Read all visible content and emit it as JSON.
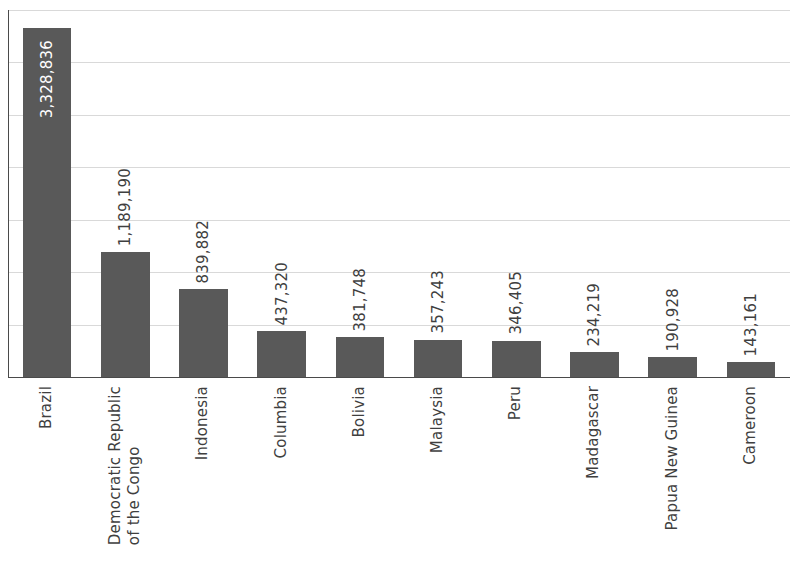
{
  "chart_data": {
    "type": "bar",
    "title": "",
    "subtitle": "",
    "xlabel": "",
    "ylabel": "",
    "categories": [
      "Brazil",
      "Democratic Republic of the Congo",
      "Indonesia",
      "Columbia",
      "Bolivia",
      "Malaysia",
      "Peru",
      "Madagascar",
      "Papua New Guinea",
      "Cameroon"
    ],
    "category_lines": [
      [
        "Brazil"
      ],
      [
        "Democratic Republic",
        "of the Congo"
      ],
      [
        "Indonesia"
      ],
      [
        "Columbia"
      ],
      [
        "Bolivia"
      ],
      [
        "Malaysia"
      ],
      [
        "Peru"
      ],
      [
        "Madagascar"
      ],
      [
        "Papua New Guinea"
      ],
      [
        "Cameroon"
      ]
    ],
    "values": [
      3328836,
      1189190,
      839882,
      437320,
      381748,
      357243,
      346405,
      234219,
      190928,
      143161
    ],
    "value_labels": [
      "3,328,836",
      "1,189,190",
      "839,882",
      "437,320",
      "381,748",
      "357,243",
      "346,405",
      "234,219",
      "190,928",
      "143,161"
    ],
    "label_inside_bar": [
      true,
      false,
      false,
      false,
      false,
      false,
      false,
      false,
      false,
      false
    ],
    "ylim": [
      0,
      3500000
    ],
    "gridlines": [
      500000,
      1000000,
      1500000,
      2000000,
      2500000,
      3000000,
      3500000
    ],
    "grid": true,
    "y_tick_labels": [],
    "legend": [],
    "legend_position": "none",
    "bar_color": "#595959",
    "grid_color": "#d9d9d9",
    "axis_color": "#4a4a4a",
    "label_color": "#3f3f3f",
    "inside_label_color": "#ffffff",
    "background_color": "#ffffff"
  }
}
